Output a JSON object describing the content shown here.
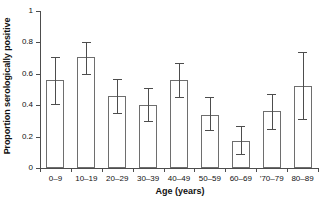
{
  "chart_data": {
    "type": "bar",
    "title": "",
    "xlabel": "Age (years)",
    "ylabel": "Proportion serologically positive",
    "categories": [
      "0–9",
      "10–19",
      "20–29",
      "30–39",
      "40–49",
      "50–59",
      "60–69",
      "’70–79",
      "80–89"
    ],
    "values": [
      0.56,
      0.71,
      0.46,
      0.4,
      0.56,
      0.34,
      0.17,
      0.36,
      0.52
    ],
    "error_low": [
      0.41,
      0.6,
      0.35,
      0.3,
      0.45,
      0.24,
      0.09,
      0.25,
      0.31
    ],
    "error_high": [
      0.71,
      0.8,
      0.57,
      0.51,
      0.67,
      0.45,
      0.27,
      0.47,
      0.74
    ],
    "ylim": [
      0,
      1
    ],
    "yticks": [
      0,
      0.2,
      0.4,
      0.6,
      0.8,
      1
    ],
    "ytick_labels": [
      "0",
      "0.2",
      "0.4",
      "0.6",
      "0.8",
      "1"
    ],
    "grid": false,
    "legend": null,
    "error_bar_type": "confidence-interval"
  },
  "colors": {
    "bar_edge": "#6e6e6e",
    "bar_fill": "#ffffff",
    "axis": "#4d4d4d",
    "text": "#111111",
    "background": "#ffffff"
  }
}
